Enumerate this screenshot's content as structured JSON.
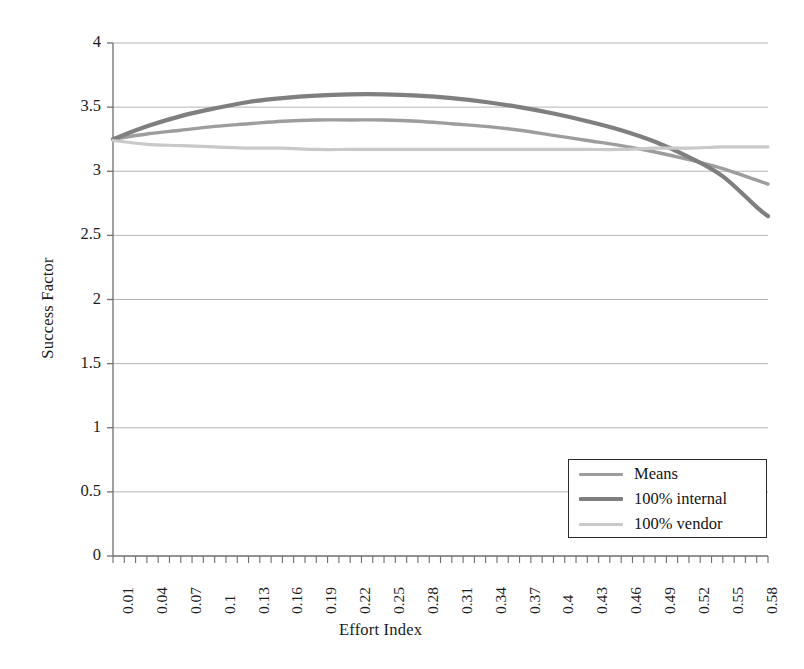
{
  "chart_data": {
    "type": "line",
    "title": "",
    "xlabel": "Effort Index",
    "ylabel": "Success Factor",
    "xlim": [
      0.01,
      0.59
    ],
    "ylim": [
      0,
      4
    ],
    "yticks": [
      "0",
      "0.5",
      "1",
      "1.5",
      "2",
      "2.5",
      "3",
      "3.5",
      "4"
    ],
    "ytick_values": [
      0,
      0.5,
      1,
      1.5,
      2,
      2.5,
      3,
      3.5,
      4
    ],
    "xticks": [
      "0.01",
      "0.04",
      "0.07",
      "0.1",
      "0.13",
      "0.16",
      "0.19",
      "0.22",
      "0.25",
      "0.28",
      "0.31",
      "0.34",
      "0.37",
      "0.4",
      "0.43",
      "0.46",
      "0.49",
      "0.52",
      "0.55",
      "0.58"
    ],
    "xtick_values": [
      0.01,
      0.04,
      0.07,
      0.1,
      0.13,
      0.16,
      0.19,
      0.22,
      0.25,
      0.28,
      0.31,
      0.34,
      0.37,
      0.4,
      0.43,
      0.46,
      0.49,
      0.52,
      0.55,
      0.58
    ],
    "minor_tick_step": 0.01,
    "grid": "horizontal",
    "legend_position": "lower-right",
    "x": [
      0.01,
      0.04,
      0.07,
      0.1,
      0.13,
      0.16,
      0.19,
      0.22,
      0.25,
      0.28,
      0.31,
      0.34,
      0.37,
      0.4,
      0.43,
      0.46,
      0.49,
      0.52,
      0.55,
      0.58,
      0.59
    ],
    "series": [
      {
        "name": "Means",
        "color": "#9d9d9d",
        "width": 3.4,
        "values": [
          3.25,
          3.29,
          3.32,
          3.35,
          3.37,
          3.39,
          3.4,
          3.4,
          3.4,
          3.39,
          3.37,
          3.35,
          3.32,
          3.28,
          3.24,
          3.2,
          3.15,
          3.09,
          3.02,
          2.93,
          2.9
        ]
      },
      {
        "name": "100% internal",
        "color": "#7f7f7f",
        "width": 4.2,
        "values": [
          3.25,
          3.35,
          3.43,
          3.49,
          3.54,
          3.57,
          3.59,
          3.6,
          3.6,
          3.59,
          3.57,
          3.54,
          3.5,
          3.45,
          3.39,
          3.32,
          3.23,
          3.11,
          2.96,
          2.72,
          2.65
        ]
      },
      {
        "name": "100% vendor",
        "color": "#c9c9c9",
        "width": 3.2,
        "values": [
          3.24,
          3.21,
          3.2,
          3.19,
          3.18,
          3.18,
          3.17,
          3.17,
          3.17,
          3.17,
          3.17,
          3.17,
          3.17,
          3.17,
          3.17,
          3.17,
          3.18,
          3.18,
          3.19,
          3.19,
          3.19
        ]
      }
    ],
    "colors": {
      "axis": "#6e6e6e",
      "grid": "#b4b4b4",
      "text": "#1c1c1c",
      "legend_border": "#2b2b2b",
      "background": "#ffffff"
    },
    "geometry": {
      "plot_left": 113,
      "plot_right": 768,
      "plot_top": 43,
      "plot_bottom": 556
    }
  },
  "legend": {
    "items": [
      {
        "label": "Means"
      },
      {
        "label": "100% internal"
      },
      {
        "label": "100% vendor"
      }
    ]
  }
}
